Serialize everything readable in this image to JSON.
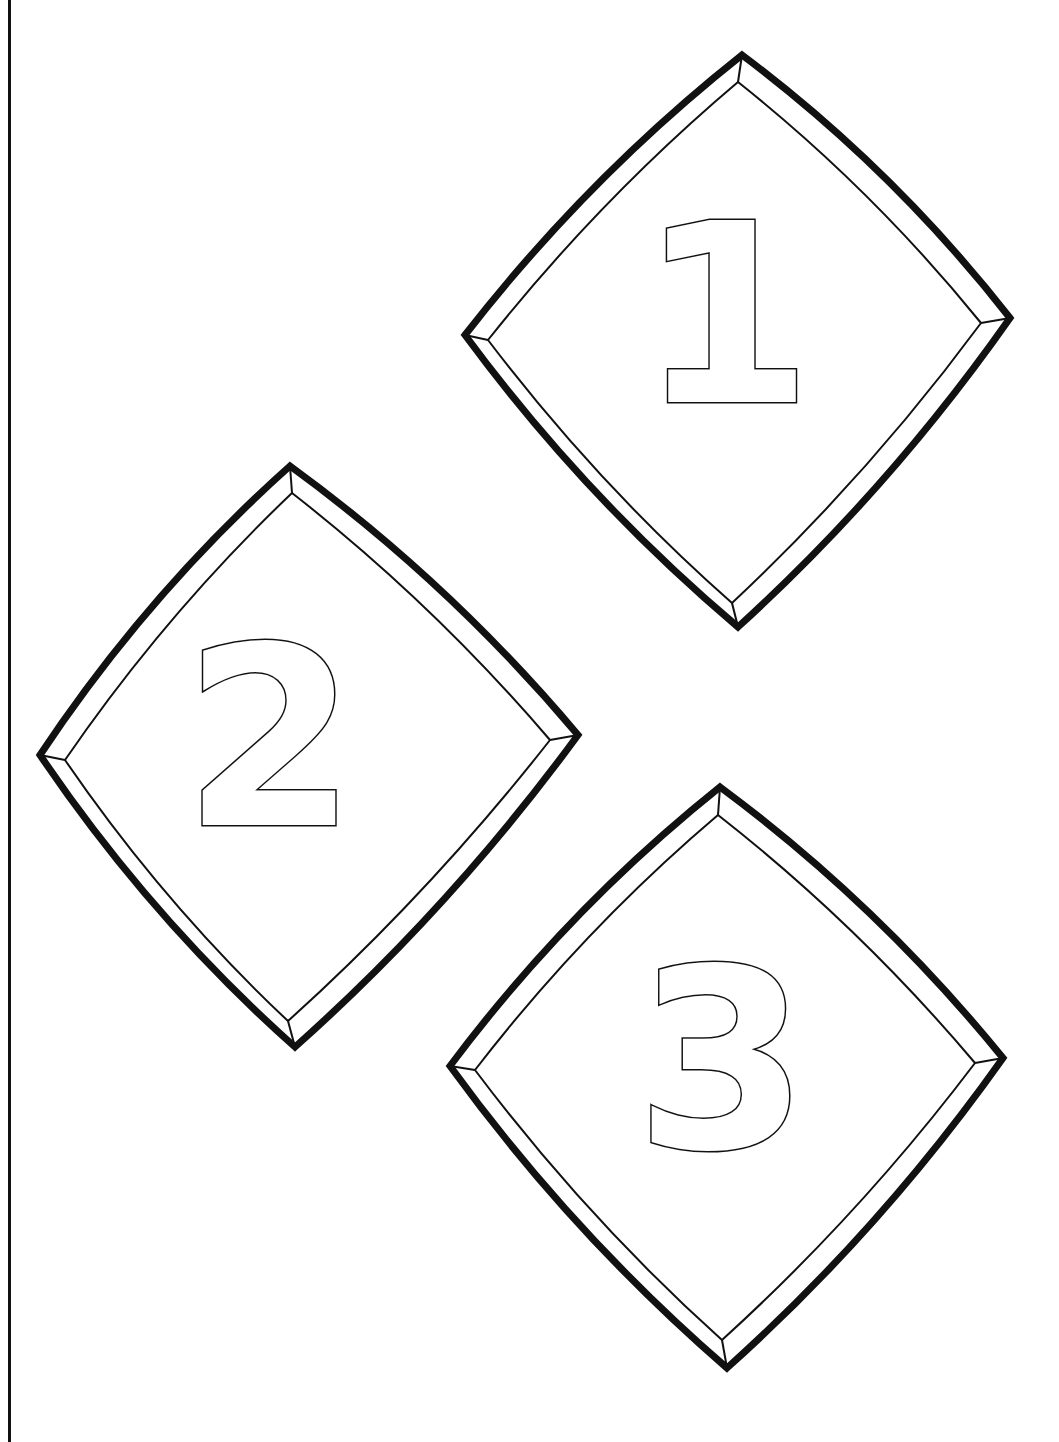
{
  "page": {
    "type": "coloring page",
    "background": "#ffffff",
    "line_color": "#111111",
    "left_border": true
  },
  "tiles": [
    {
      "label": "1",
      "outer": {
        "top": [
          742,
          55
        ],
        "right": [
          1010,
          318
        ],
        "bottom": [
          738,
          627
        ],
        "left": [
          465,
          335
        ]
      },
      "inner": {
        "top": [
          738,
          82
        ],
        "right": [
          981,
          323
        ],
        "bottom": [
          732,
          603
        ],
        "left": [
          488,
          340
        ]
      },
      "digit_center": [
        726,
        315
      ],
      "digit_size": 250
    },
    {
      "label": "2",
      "outer": {
        "top": [
          290,
          466
        ],
        "right": [
          578,
          735
        ],
        "bottom": [
          295,
          1047
        ],
        "left": [
          40,
          755
        ]
      },
      "inner": {
        "top": [
          292,
          493
        ],
        "right": [
          550,
          740
        ],
        "bottom": [
          288,
          1021
        ],
        "left": [
          65,
          760
        ]
      },
      "digit_center": [
        270,
        738
      ],
      "digit_size": 250
    },
    {
      "label": "3",
      "outer": {
        "top": [
          720,
          787
        ],
        "right": [
          1003,
          1058
        ],
        "bottom": [
          727,
          1368
        ],
        "left": [
          450,
          1066
        ]
      },
      "inner": {
        "top": [
          718,
          815
        ],
        "right": [
          975,
          1063
        ],
        "bottom": [
          722,
          1340
        ],
        "left": [
          475,
          1070
        ]
      },
      "digit_center": [
        722,
        1060
      ],
      "digit_size": 250
    }
  ]
}
